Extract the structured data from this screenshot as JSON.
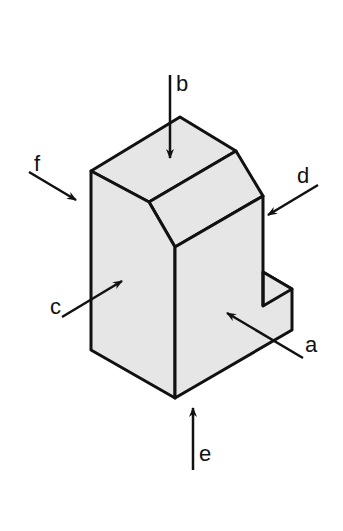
{
  "diagram": {
    "type": "isometric-view-of-block-with-viewing-directions",
    "colors": {
      "fill": "#e6e6e6",
      "stroke": "#111111",
      "background": "#ffffff"
    },
    "arrows": [
      {
        "label": "a",
        "description": "view direction onto front-right face"
      },
      {
        "label": "b",
        "description": "view direction from top"
      },
      {
        "label": "c",
        "description": "view direction onto left face"
      },
      {
        "label": "d",
        "description": "view direction from right"
      },
      {
        "label": "e",
        "description": "view direction from bottom"
      },
      {
        "label": "f",
        "description": "view direction from rear-left"
      }
    ]
  }
}
